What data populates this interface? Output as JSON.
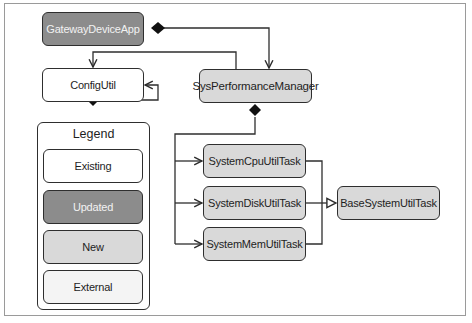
{
  "diagram": {
    "nodes": {
      "gateway_device_app": {
        "label": "GatewayDeviceApp",
        "kind": "Updated"
      },
      "config_util": {
        "label": "ConfigUtil",
        "kind": "Existing"
      },
      "sys_performance_manager": {
        "label": "SysPerformanceManager",
        "kind": "New"
      },
      "system_cpu_util_task": {
        "label": "SystemCpuUtilTask",
        "kind": "New"
      },
      "system_disk_util_task": {
        "label": "SystemDiskUtilTask",
        "kind": "New"
      },
      "system_mem_util_task": {
        "label": "SystemMemUtilTask",
        "kind": "New"
      },
      "base_system_util_task": {
        "label": "BaseSystemUtilTask",
        "kind": "New"
      }
    },
    "edges": [
      {
        "from": "GatewayDeviceApp",
        "to": "SysPerformanceManager",
        "type": "composition"
      },
      {
        "from": "SysPerformanceManager",
        "to": "ConfigUtil",
        "type": "association"
      },
      {
        "from": "ConfigUtil",
        "to": "ConfigUtil",
        "type": "composition-self"
      },
      {
        "from": "SysPerformanceManager",
        "to": "SystemCpuUtilTask",
        "type": "composition"
      },
      {
        "from": "SysPerformanceManager",
        "to": "SystemDiskUtilTask",
        "type": "composition"
      },
      {
        "from": "SysPerformanceManager",
        "to": "SystemMemUtilTask",
        "type": "composition"
      },
      {
        "from": "SystemCpuUtilTask",
        "to": "BaseSystemUtilTask",
        "type": "generalization"
      },
      {
        "from": "SystemDiskUtilTask",
        "to": "BaseSystemUtilTask",
        "type": "generalization"
      },
      {
        "from": "SystemMemUtilTask",
        "to": "BaseSystemUtilTask",
        "type": "generalization"
      }
    ]
  },
  "legend": {
    "title": "Legend",
    "items": [
      {
        "label": "Existing",
        "color": "#ffffff"
      },
      {
        "label": "Updated",
        "color": "#8c8c8c"
      },
      {
        "label": "New",
        "color": "#d9d9d9"
      },
      {
        "label": "External",
        "color": "#f4f4f4"
      }
    ]
  }
}
